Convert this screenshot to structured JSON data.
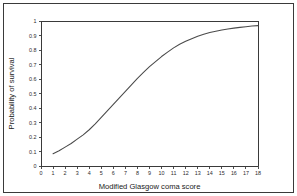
{
  "chart_data": {
    "type": "line",
    "title": "",
    "xlabel": "Modified Glasgow coma score",
    "ylabel": "Probability of survival",
    "xlim": [
      0,
      18
    ],
    "ylim": [
      0,
      1
    ],
    "grid": false,
    "legend": "none",
    "x_ticks": [
      "0",
      "1",
      "2",
      "3",
      "4",
      "5",
      "6",
      "7",
      "8",
      "9",
      "10",
      "11",
      "12",
      "13",
      "14",
      "15",
      "16",
      "17",
      "18"
    ],
    "y_ticks": [
      "0",
      "0.1",
      "0.2",
      "0.3",
      "0.4",
      "0.5",
      "0.6",
      "0.7",
      "0.8",
      "0.9",
      "1"
    ],
    "series": [
      {
        "name": "Probability of survival",
        "color": "#4a4a4a",
        "x": [
          1,
          1.5,
          2,
          2.5,
          3,
          3.5,
          4,
          4.5,
          5,
          5.5,
          6,
          6.5,
          7,
          7.5,
          8,
          8.5,
          9,
          9.5,
          10,
          10.5,
          11,
          11.5,
          12,
          12.5,
          13,
          13.5,
          14,
          14.5,
          15,
          15.5,
          16,
          16.5,
          17,
          17.5,
          18
        ],
        "values": [
          0.085,
          0.105,
          0.13,
          0.155,
          0.185,
          0.215,
          0.25,
          0.29,
          0.335,
          0.38,
          0.425,
          0.47,
          0.515,
          0.56,
          0.605,
          0.645,
          0.685,
          0.72,
          0.755,
          0.785,
          0.815,
          0.84,
          0.86,
          0.878,
          0.895,
          0.908,
          0.92,
          0.929,
          0.938,
          0.945,
          0.951,
          0.956,
          0.961,
          0.965,
          0.968
        ]
      }
    ]
  },
  "figure": {
    "frame_color": "#3a3a3a",
    "background": "#ffffff"
  }
}
